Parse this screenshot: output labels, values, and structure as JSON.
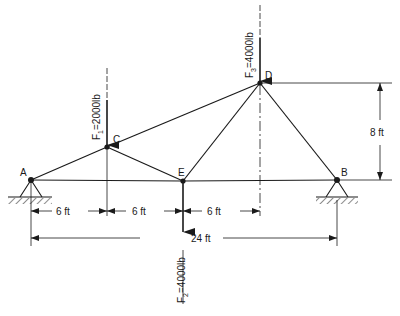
{
  "diagram": {
    "type": "truss",
    "nodes": {
      "A": {
        "label": "A",
        "x": 31,
        "y": 180
      },
      "B": {
        "label": "B",
        "x": 337,
        "y": 180
      },
      "C": {
        "label": "C",
        "x": 107,
        "y": 147
      },
      "D": {
        "label": "D",
        "x": 260,
        "y": 83
      },
      "E": {
        "label": "E",
        "x": 183,
        "y": 181
      }
    },
    "members": [
      [
        "A",
        "C"
      ],
      [
        "C",
        "D"
      ],
      [
        "A",
        "E"
      ],
      [
        "E",
        "B"
      ],
      [
        "C",
        "E"
      ],
      [
        "E",
        "D"
      ],
      [
        "D",
        "B"
      ]
    ],
    "supports": [
      {
        "node": "A",
        "type": "pin"
      },
      {
        "node": "B",
        "type": "pin"
      }
    ],
    "forces": {
      "F1": {
        "label_main": "F",
        "label_sub": "1",
        "label_rest": "=2000lb",
        "node": "C"
      },
      "F2": {
        "label_main": "F",
        "label_sub": "2",
        "label_rest": "=4000lb",
        "node": "E"
      },
      "F3": {
        "label_main": "F",
        "label_sub": "3",
        "label_rest": "=4000lb",
        "node": "D"
      }
    },
    "dimensions": {
      "seg1": "6 ft",
      "seg2": "6 ft",
      "seg3": "6 ft",
      "span": "24 ft",
      "height": "8 ft"
    }
  }
}
